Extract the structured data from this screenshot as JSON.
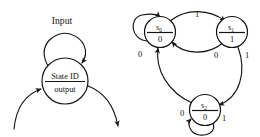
{
  "figure": {
    "background_color": "#ffffff",
    "ink_color": "#141414"
  },
  "legend": {
    "name": "state-notation-legend",
    "self_loop_label": "Input",
    "node": {
      "state_id_label": "State ID",
      "output_label": "output"
    },
    "incoming_arrow": "incoming transition",
    "outgoing_arrow": "outgoing transition"
  },
  "state_machine": {
    "name": "three-state-diagram",
    "states": [
      {
        "id": "s0",
        "id_base": "s",
        "id_sub": "0",
        "output": "0"
      },
      {
        "id": "s1",
        "id_base": "s",
        "id_sub": "1",
        "output": "1"
      },
      {
        "id": "s2",
        "id_base": "s",
        "id_sub": "2",
        "output": "0"
      }
    ],
    "transitions": [
      {
        "from": "s0",
        "to": "s0",
        "input": "0"
      },
      {
        "from": "s0",
        "to": "s1",
        "input": "1"
      },
      {
        "from": "s1",
        "to": "s0",
        "input": "0"
      },
      {
        "from": "s1",
        "to": "s2",
        "input": "1"
      },
      {
        "from": "s2",
        "to": "s0",
        "input": "0"
      },
      {
        "from": "s2",
        "to": "s2",
        "input": "1"
      }
    ]
  }
}
